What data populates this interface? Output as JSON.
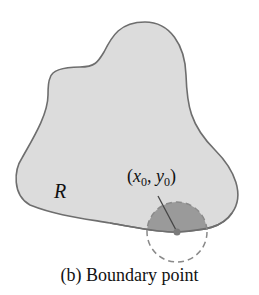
{
  "figure": {
    "region_label": "R",
    "point_label": {
      "open": "(",
      "x": "x",
      "x_sub": "0",
      "sep": ", ",
      "y": "y",
      "y_sub": "0",
      "close": ")"
    },
    "caption": "(b) Boundary point",
    "colors": {
      "region_fill": "#dcdcdc",
      "region_stroke": "#6e6e6e",
      "disk_inside_fill": "#9a9a9a",
      "dashed_circle": "#8a8a8a",
      "point": "#7a7a7a"
    }
  }
}
